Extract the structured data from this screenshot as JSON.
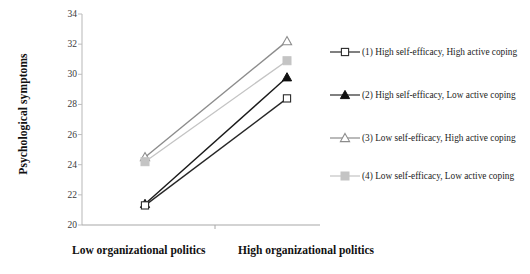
{
  "chart_data": {
    "type": "line",
    "title": "",
    "xlabel": "",
    "ylabel": "Psychological symptoms",
    "categories": [
      "Low organizational politics",
      "High organizational politics"
    ],
    "ylim": [
      20,
      34
    ],
    "ytick_step": 2,
    "yticks": [
      "34",
      "32",
      "30",
      "28",
      "26",
      "24",
      "22",
      "20"
    ],
    "grid": false,
    "legend_position": "right",
    "series": [
      {
        "name": "(1) High self-efficacy,  High active coping",
        "values": [
          21.3,
          28.4
        ],
        "marker": "open-square",
        "color": "#262626"
      },
      {
        "name": "(2) High self-efficacy,  Low active coping",
        "values": [
          21.4,
          29.8
        ],
        "marker": "filled-triangle",
        "color": "#1a1a1a"
      },
      {
        "name": "(3) Low self-efficacy,  High active coping",
        "values": [
          24.5,
          32.2
        ],
        "marker": "open-triangle",
        "color": "#8c8c8c"
      },
      {
        "name": "(4) Low self-efficacy,  Low active coping",
        "values": [
          24.2,
          30.9
        ],
        "marker": "filled-square",
        "color": "#c4c4c4"
      }
    ]
  },
  "axis": {
    "y_title": "Psychological symptoms"
  },
  "legend": {
    "items": [
      {
        "label": "(1) High self-efficacy,  High active coping"
      },
      {
        "label": "(2) High self-efficacy,  Low active coping"
      },
      {
        "label": "(3) Low self-efficacy,  High active coping"
      },
      {
        "label": "(4) Low self-efficacy,  Low active coping"
      }
    ]
  }
}
